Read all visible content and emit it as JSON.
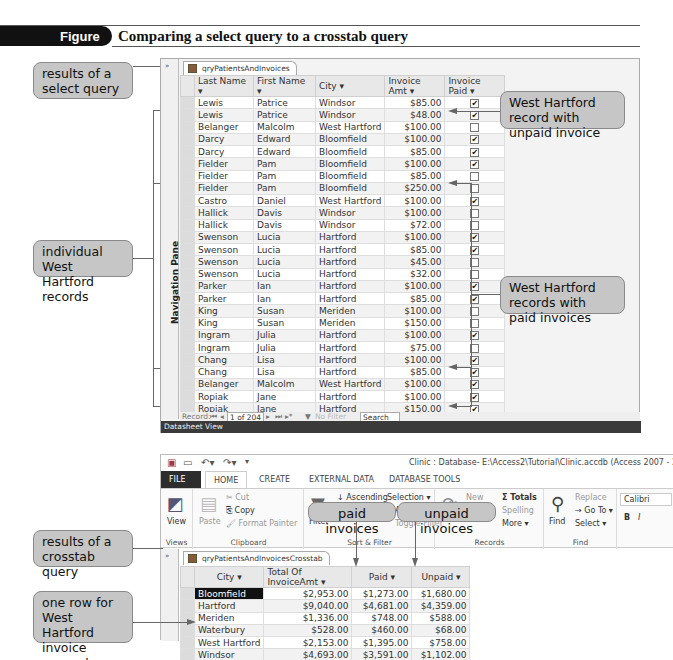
{
  "figure": {
    "number": "Figure 5-18",
    "title": "Comparing a select query to a crosstab query"
  },
  "callouts": {
    "select_results": "results of a select query",
    "individual_wh": "individual West Hartford records",
    "wh_unpaid": "West Hartford record with unpaid invoice",
    "wh_paid": "West Hartford records with paid invoices",
    "crosstab_results": "results of a crosstab query",
    "one_row_wh": "one row for West Hartford invoice amounts",
    "paid_invoices": "paid invoices",
    "unpaid_invoices": "unpaid invoices"
  },
  "select_query": {
    "nav_pane_label": "Navigation Pane",
    "tab_label": "qryPatientsAndInvoices",
    "columns": [
      "Last Name",
      "First Name",
      "City",
      "Invoice Amt",
      "Invoice Paid"
    ],
    "rows": [
      [
        "Lewis",
        "Patrice",
        "Windsor",
        "$85.00",
        true
      ],
      [
        "Lewis",
        "Patrice",
        "Windsor",
        "$48.00",
        true
      ],
      [
        "Belanger",
        "Malcolm",
        "West Hartford",
        "$100.00",
        false
      ],
      [
        "Darcy",
        "Edward",
        "Bloomfield",
        "$100.00",
        true
      ],
      [
        "Darcy",
        "Edward",
        "Bloomfield",
        "$85.00",
        true
      ],
      [
        "Fielder",
        "Pam",
        "Bloomfield",
        "$100.00",
        true
      ],
      [
        "Fielder",
        "Pam",
        "Bloomfield",
        "$85.00",
        false
      ],
      [
        "Fielder",
        "Pam",
        "Bloomfield",
        "$250.00",
        false
      ],
      [
        "Castro",
        "Daniel",
        "West Hartford",
        "$100.00",
        true
      ],
      [
        "Hallick",
        "Davis",
        "Windsor",
        "$100.00",
        false
      ],
      [
        "Hallick",
        "Davis",
        "Windsor",
        "$72.00",
        false
      ],
      [
        "Swenson",
        "Lucia",
        "Hartford",
        "$100.00",
        true
      ],
      [
        "Swenson",
        "Lucia",
        "Hartford",
        "$85.00",
        true
      ],
      [
        "Swenson",
        "Lucia",
        "Hartford",
        "$45.00",
        false
      ],
      [
        "Swenson",
        "Lucia",
        "Hartford",
        "$32.00",
        false
      ],
      [
        "Parker",
        "Ian",
        "Hartford",
        "$100.00",
        true
      ],
      [
        "Parker",
        "Ian",
        "Hartford",
        "$85.00",
        true
      ],
      [
        "King",
        "Susan",
        "Meriden",
        "$100.00",
        false
      ],
      [
        "King",
        "Susan",
        "Meriden",
        "$150.00",
        false
      ],
      [
        "Ingram",
        "Julia",
        "Hartford",
        "$100.00",
        true
      ],
      [
        "Ingram",
        "Julia",
        "Hartford",
        "$75.00",
        false
      ],
      [
        "Chang",
        "Lisa",
        "Hartford",
        "$100.00",
        true
      ],
      [
        "Chang",
        "Lisa",
        "Hartford",
        "$85.00",
        true
      ],
      [
        "Belanger",
        "Malcolm",
        "West Hartford",
        "$100.00",
        true
      ],
      [
        "Ropiak",
        "Jane",
        "Hartford",
        "$100.00",
        true
      ],
      [
        "Ropiak",
        "Jane",
        "Hartford",
        "$150.00",
        true
      ],
      [
        "Shaw",
        "Daniel",
        "West Hartford",
        "$100.00",
        true
      ]
    ],
    "record_nav": {
      "label": "Record:",
      "position": "1 of 204",
      "filter": "No Filter",
      "search": "Search"
    },
    "status_bar": "Datasheet View"
  },
  "access_window": {
    "title": "Clinic : Database- E:\\Access2\\Tutorial\\Clinic.accdb (Access 2007 - 2013 fil",
    "ribbon_tabs": [
      "FILE",
      "HOME",
      "CREATE",
      "EXTERNAL DATA",
      "DATABASE TOOLS"
    ],
    "groups": {
      "views": {
        "name": "Views",
        "view": "View"
      },
      "clipboard": {
        "name": "Clipboard",
        "paste": "Paste",
        "cut": "Cut",
        "copy": "Copy",
        "format_painter": "Format Painter"
      },
      "sort_filter": {
        "name": "Sort & Filter",
        "filter": "Filter",
        "ascending": "Ascending",
        "selection": "Selection ▾",
        "advanced": "Advanced",
        "toggle": "Toggle Filter"
      },
      "records": {
        "name": "Records",
        "new": "New",
        "totals": "Totals",
        "spelling": "Spelling",
        "more": "More ▾",
        "refresh": "Refresh All"
      },
      "find": {
        "name": "Find",
        "find": "Find",
        "replace": "Replace",
        "goto": "Go To ▾",
        "select": "Select ▾"
      },
      "font": {
        "font_name": "Calibri",
        "bold": "B",
        "italic": "I"
      }
    }
  },
  "crosstab_query": {
    "tab_label": "qryPatientsAndInvoicesCrosstab",
    "columns": [
      "City",
      "Total Of InvoiceAmt",
      "Paid",
      "Unpaid"
    ],
    "rows": [
      [
        "Bloomfield",
        "$2,953.00",
        "$1,273.00",
        "$1,680.00"
      ],
      [
        "Hartford",
        "$9,040.00",
        "$4,681.00",
        "$4,359.00"
      ],
      [
        "Meriden",
        "$1,336.00",
        "$748.00",
        "$588.00"
      ],
      [
        "Waterbury",
        "$528.00",
        "$460.00",
        "$68.00"
      ],
      [
        "West Hartford",
        "$2,153.00",
        "$1,395.00",
        "$758.00"
      ],
      [
        "Windsor",
        "$4,693.00",
        "$3,591.00",
        "$1,102.00"
      ]
    ]
  }
}
